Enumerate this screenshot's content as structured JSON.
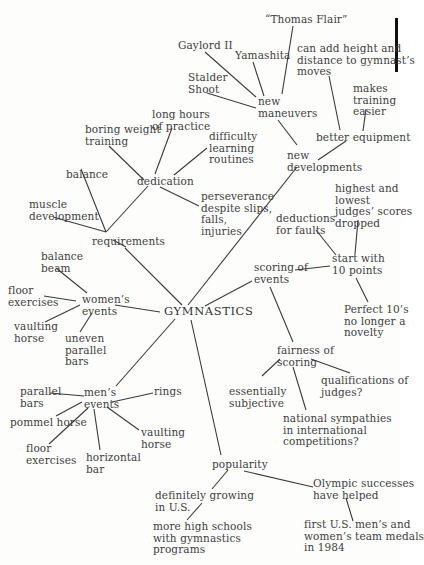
{
  "diagram": {
    "type": "mind-map",
    "root": "GYMNASTICS",
    "nodes": {
      "gymnastics": "GYMNASTICS",
      "requirements": "requirements",
      "balance": "balance",
      "muscle_development": "muscle\ndevelopment",
      "dedication": "dedication",
      "boring_weight_training": "boring weight\ntraining",
      "long_hours": "long hours\nof practice",
      "difficulty_learning": "difficulty\nlearning\nroutines",
      "perseverance": "perseverance\ndespite slips,\nfalls,\ninjuries",
      "new_developments": "new\ndevelopments",
      "new_maneuvers": "new\nmaneuvers",
      "gaylord": "Gaylord II",
      "yamashita": "Yamashita",
      "thomas_flair": "“Thomas Flair”",
      "stalder_shoot": "Stalder\nShoot",
      "better_equipment": "better equipment",
      "height_distance": "can add height and\ndistance to gymnast’s\nmoves",
      "makes_training_easier": "makes\ntraining\neasier",
      "scoring_of_events": "scoring of\nevents",
      "start_with_10": "start with\n10 points",
      "deductions": "deductions\nfor faults",
      "highest_lowest": "highest and\nlowest\njudges’ scores\ndropped",
      "perfect_10": "Perfect 10’s\nno longer a\nnovelty",
      "fairness": "fairness of\nscoring",
      "essentially_subjective": "essentially\nsubjective",
      "qualifications": "qualifications of\njudges?",
      "national_sympathies": "national sympathies\nin international\ncompetitions?",
      "womens_events": "women’s\nevents",
      "balance_beam": "balance\nbeam",
      "w_floor": "floor\nexercises",
      "w_vaulting": "vaulting\nhorse",
      "uneven_bars": "uneven\nparallel\nbars",
      "mens_events": "men’s\nevents",
      "parallel_bars": "parallel\nbars",
      "pommel_horse": "pommel horse",
      "m_floor": "floor\nexercises",
      "horizontal_bar": "horizontal\nbar",
      "m_vaulting": "vaulting\nhorse",
      "rings": "rings",
      "popularity": "popularity",
      "growing_us": "definitely growing\nin U.S.",
      "high_schools": "more high schools\nwith gymnastics\nprograms",
      "olympic": "Olympic successes\nhave helped",
      "medals_1984": "first U.S. men’s and\nwomen’s team medals\nin 1984"
    },
    "edges": [
      [
        "gymnastics",
        "requirements"
      ],
      [
        "gymnastics",
        "new_developments"
      ],
      [
        "gymnastics",
        "scoring_of_events"
      ],
      [
        "gymnastics",
        "womens_events"
      ],
      [
        "gymnastics",
        "mens_events"
      ],
      [
        "gymnastics",
        "popularity"
      ],
      [
        "requirements",
        "balance"
      ],
      [
        "requirements",
        "muscle_development"
      ],
      [
        "requirements",
        "dedication"
      ],
      [
        "dedication",
        "boring_weight_training"
      ],
      [
        "dedication",
        "long_hours"
      ],
      [
        "dedication",
        "difficulty_learning"
      ],
      [
        "dedication",
        "perseverance"
      ],
      [
        "new_developments",
        "new_maneuvers"
      ],
      [
        "new_developments",
        "better_equipment"
      ],
      [
        "new_maneuvers",
        "gaylord"
      ],
      [
        "new_maneuvers",
        "yamashita"
      ],
      [
        "new_maneuvers",
        "thomas_flair"
      ],
      [
        "new_maneuvers",
        "stalder_shoot"
      ],
      [
        "better_equipment",
        "height_distance"
      ],
      [
        "better_equipment",
        "makes_training_easier"
      ],
      [
        "scoring_of_events",
        "start_with_10"
      ],
      [
        "scoring_of_events",
        "fairness"
      ],
      [
        "start_with_10",
        "deductions"
      ],
      [
        "start_with_10",
        "highest_lowest"
      ],
      [
        "start_with_10",
        "perfect_10"
      ],
      [
        "fairness",
        "essentially_subjective"
      ],
      [
        "fairness",
        "qualifications"
      ],
      [
        "fairness",
        "national_sympathies"
      ],
      [
        "womens_events",
        "balance_beam"
      ],
      [
        "womens_events",
        "w_floor"
      ],
      [
        "womens_events",
        "w_vaulting"
      ],
      [
        "womens_events",
        "uneven_bars"
      ],
      [
        "mens_events",
        "parallel_bars"
      ],
      [
        "mens_events",
        "pommel_horse"
      ],
      [
        "mens_events",
        "m_floor"
      ],
      [
        "mens_events",
        "horizontal_bar"
      ],
      [
        "mens_events",
        "m_vaulting"
      ],
      [
        "mens_events",
        "rings"
      ],
      [
        "popularity",
        "growing_us"
      ],
      [
        "popularity",
        "olympic"
      ],
      [
        "growing_us",
        "high_schools"
      ],
      [
        "olympic",
        "medals_1984"
      ]
    ]
  }
}
